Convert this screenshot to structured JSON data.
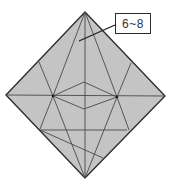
{
  "diagram": {
    "type": "origami-crease-pattern",
    "shape": "square rotated 45 degrees (diamond)",
    "paper_color": "#c4c4c4",
    "outline_color": "#2e2e2e",
    "crease_color": "#4a4a4a",
    "callout": {
      "label": "6~8",
      "points_to": "upper central region of diamond"
    },
    "features": [
      "center vertical crease",
      "center horizontal crease",
      "small inner rhombus at center",
      "two crease intersection nodes on horizontal line",
      "lower horizontal crease",
      "lower diagonal crease"
    ]
  }
}
